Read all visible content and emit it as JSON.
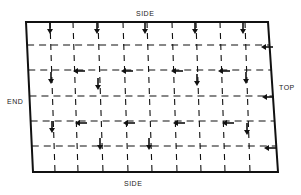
{
  "labels": {
    "top_side": "SIDE",
    "bottom_side": "SIDE",
    "left_end": "END",
    "right_top": "TOP"
  },
  "colors": {
    "ink": "#111111",
    "background": "#ffffff"
  },
  "panel": {
    "corners": {
      "top_left": [
        26,
        22
      ],
      "top_right": [
        268,
        22
      ],
      "bottom_right": [
        278,
        172
      ],
      "bottom_left": [
        33,
        172
      ]
    },
    "vertical_gridlines_top_x": [
      50,
      73,
      98,
      123,
      147,
      172,
      196,
      220,
      245
    ],
    "horizontal_gridlines_y": [
      45,
      70,
      96,
      121,
      146
    ]
  },
  "arrows": [
    {
      "dir": "down",
      "x": 50,
      "y": 28
    },
    {
      "dir": "down",
      "x": 97,
      "y": 28
    },
    {
      "dir": "down",
      "x": 145,
      "y": 28
    },
    {
      "dir": "down",
      "x": 195,
      "y": 28
    },
    {
      "dir": "down",
      "x": 243,
      "y": 28
    },
    {
      "dir": "left",
      "x": 266,
      "y": 47
    },
    {
      "dir": "left",
      "x": 78,
      "y": 71
    },
    {
      "dir": "left",
      "x": 126,
      "y": 71
    },
    {
      "dir": "left",
      "x": 176,
      "y": 71
    },
    {
      "dir": "left",
      "x": 223,
      "y": 71
    },
    {
      "dir": "down",
      "x": 51,
      "y": 78
    },
    {
      "dir": "down",
      "x": 98,
      "y": 84
    },
    {
      "dir": "down",
      "x": 197,
      "y": 80
    },
    {
      "dir": "down",
      "x": 246,
      "y": 78
    },
    {
      "dir": "left",
      "x": 267,
      "y": 97
    },
    {
      "dir": "left",
      "x": 80,
      "y": 123
    },
    {
      "dir": "left",
      "x": 128,
      "y": 123
    },
    {
      "dir": "left",
      "x": 178,
      "y": 123
    },
    {
      "dir": "left",
      "x": 227,
      "y": 123
    },
    {
      "dir": "down",
      "x": 52,
      "y": 127
    },
    {
      "dir": "down",
      "x": 247,
      "y": 129
    },
    {
      "dir": "down",
      "x": 100,
      "y": 144
    },
    {
      "dir": "down",
      "x": 149,
      "y": 144
    },
    {
      "dir": "left",
      "x": 269,
      "y": 148
    }
  ]
}
